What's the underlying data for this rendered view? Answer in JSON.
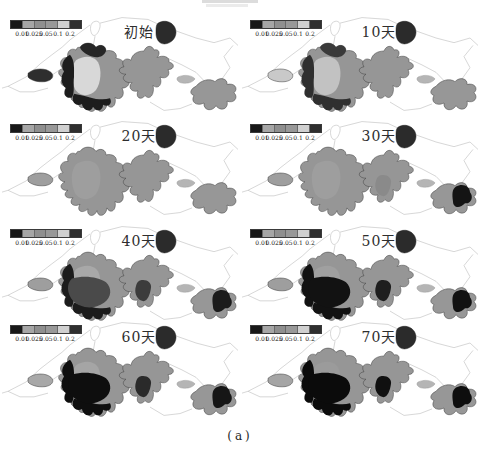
{
  "figure": {
    "caption_label": "(a)",
    "legend": {
      "tick_labels": [
        "0.01",
        "0.025",
        "0.05",
        "0.1",
        "0.2"
      ],
      "segment_colors": [
        "#181818",
        "#a6a6a6",
        "#8f8f8f",
        "#989898",
        "#d0d0d0",
        "#2f2f2f"
      ]
    },
    "panels": [
      {
        "title": "初始"
      },
      {
        "title": "10天"
      },
      {
        "title": "20天"
      },
      {
        "title": "30天"
      },
      {
        "title": "40天"
      },
      {
        "title": "50天"
      },
      {
        "title": "60天"
      },
      {
        "title": "70天"
      }
    ]
  },
  "map": {
    "colors": {
      "water_medium": "#969696",
      "water_light": "#d8d8d8",
      "water_dark": "#141414",
      "boundary_line": "#c4c4c4",
      "outline": "#3a3a3a"
    }
  }
}
